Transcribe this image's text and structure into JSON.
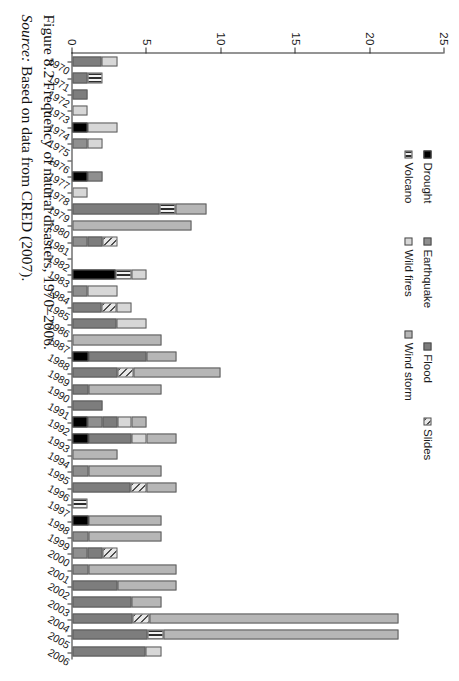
{
  "figure": {
    "caption_label": "Figure 8.2",
    "caption_text": "Frequency of natural disasters, 1970–2006.",
    "source_label": "Source:",
    "source_text": "Based on data from CRED (2007)."
  },
  "legend": {
    "rows": [
      [
        {
          "name": "Drought",
          "color": "#000000",
          "key": "drought"
        },
        {
          "name": "Earthquake",
          "color": "#8f8f8f",
          "key": "earthquake"
        },
        {
          "name": "Flood",
          "color": "#7d7d7d",
          "key": "flood"
        },
        {
          "name": "Slides",
          "color": "#4f4f4f",
          "key": "slides"
        }
      ],
      [
        {
          "name": "Volcano",
          "color": "#2d2d2d",
          "key": "volcano"
        },
        {
          "name": "Wild fires",
          "color": "#d7d7d7",
          "key": "wildfires"
        },
        {
          "name": "Wind storm",
          "color": "#b6b6b6",
          "key": "windstorm"
        }
      ]
    ]
  },
  "axis": {
    "value_ticks": [
      0,
      5,
      10,
      15,
      20,
      25
    ],
    "value_min": 0,
    "value_max": 25,
    "value_axis_title": ""
  },
  "chart_data": {
    "type": "bar",
    "orientation": "horizontal-rotated",
    "stacked": true,
    "title": "Frequency of natural disasters, 1970–2006.",
    "xlabel": "",
    "ylabel": "",
    "ylim": [
      0,
      25
    ],
    "grid": false,
    "legend_position": "upper-left",
    "categories": [
      "1970",
      "1971",
      "1972",
      "1973",
      "1974",
      "1975",
      "1976",
      "1977",
      "1978",
      "1979",
      "1980",
      "1981",
      "1982",
      "1983",
      "1984",
      "1985",
      "1986",
      "1987",
      "1988",
      "1989",
      "1990",
      "1991",
      "1992",
      "1993",
      "1994",
      "1995",
      "1996",
      "1997",
      "1998",
      "1999",
      "2000",
      "2001",
      "2002",
      "2003",
      "2004",
      "2005",
      "2006"
    ],
    "series": [
      {
        "name": "Drought",
        "key": "drought",
        "values": [
          0,
          0,
          0,
          0,
          1,
          0,
          0,
          1,
          0,
          0,
          0,
          0,
          0,
          3,
          0,
          0,
          0,
          0,
          1,
          0,
          0,
          0,
          1,
          1,
          0,
          0,
          0,
          0,
          1,
          0,
          0,
          0,
          0,
          0,
          0,
          0,
          0
        ]
      },
      {
        "name": "Earthquake",
        "key": "earthquake",
        "values": [
          0,
          0,
          0,
          0,
          0,
          1,
          0,
          1,
          0,
          0,
          0,
          1,
          0,
          0,
          1,
          0,
          0,
          0,
          0,
          0,
          0,
          0,
          1,
          0,
          0,
          1,
          0,
          0,
          0,
          1,
          1,
          1,
          0,
          0,
          0,
          0,
          0
        ]
      },
      {
        "name": "Flood",
        "key": "flood",
        "values": [
          2,
          1,
          1,
          0,
          0,
          0,
          0,
          0,
          0,
          6,
          0,
          1,
          0,
          0,
          0,
          2,
          3,
          0,
          4,
          3,
          1,
          2,
          1,
          3,
          0,
          0,
          4,
          0,
          0,
          0,
          1,
          0,
          3,
          4,
          4,
          5,
          5
        ]
      },
      {
        "name": "Slides",
        "key": "slides",
        "values": [
          0,
          0,
          0,
          0,
          0,
          0,
          0,
          0,
          0,
          0,
          0,
          1,
          0,
          0,
          0,
          1,
          0,
          0,
          0,
          1,
          0,
          0,
          0,
          0,
          0,
          0,
          1,
          0,
          0,
          0,
          1,
          0,
          0,
          0,
          1,
          0,
          0
        ]
      },
      {
        "name": "Volcano",
        "key": "volcano",
        "values": [
          0,
          1,
          0,
          0,
          0,
          0,
          0,
          0,
          0,
          1,
          0,
          0,
          0,
          1,
          0,
          0,
          0,
          0,
          0,
          0,
          0,
          0,
          0,
          0,
          0,
          0,
          0,
          1,
          0,
          0,
          0,
          0,
          0,
          0,
          0,
          1,
          0
        ]
      },
      {
        "name": "Wild fires",
        "key": "wildfires",
        "values": [
          1,
          0,
          0,
          1,
          2,
          1,
          0,
          0,
          1,
          0,
          0,
          0,
          0,
          1,
          2,
          1,
          2,
          0,
          0,
          0,
          0,
          0,
          1,
          1,
          0,
          0,
          0,
          0,
          0,
          0,
          0,
          0,
          0,
          0,
          0,
          0,
          1
        ]
      },
      {
        "name": "Wind storm",
        "key": "windstorm",
        "values": [
          0,
          0,
          0,
          0,
          0,
          0,
          0,
          0,
          0,
          2,
          8,
          0,
          0,
          0,
          0,
          0,
          0,
          6,
          2,
          6,
          5,
          0,
          1,
          2,
          3,
          5,
          2,
          0,
          5,
          5,
          0,
          6,
          4,
          2,
          17,
          16,
          0
        ]
      }
    ],
    "totals": [
      3,
      2,
      1,
      1,
      3,
      2,
      0,
      2,
      1,
      9,
      8,
      3,
      0,
      5,
      3,
      4,
      5,
      6,
      7,
      10,
      6,
      2,
      5,
      7,
      3,
      6,
      7,
      1,
      6,
      6,
      3,
      7,
      7,
      6,
      22,
      22,
      6
    ]
  }
}
